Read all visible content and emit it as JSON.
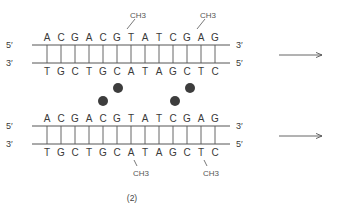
{
  "figure": {
    "caption": "(2)",
    "colors": {
      "line": "#555555",
      "text": "#3a3a3a",
      "dot": "#3d3d3d"
    },
    "duplexes": [
      {
        "id": "top",
        "top_strand": {
          "left_label": "5′",
          "right_label": "3′",
          "sequence": [
            "A",
            "C",
            "G",
            "A",
            "C",
            "G",
            "T",
            "A",
            "T",
            "C",
            "G",
            "A",
            "G"
          ]
        },
        "bottom_strand": {
          "left_label": "3′",
          "right_label": "5′",
          "sequence": [
            "T",
            "G",
            "C",
            "T",
            "G",
            "C",
            "A",
            "T",
            "A",
            "G",
            "C",
            "T",
            "C"
          ]
        },
        "methyl_groups": [
          {
            "label": "CH3",
            "strand": "top",
            "position": 6,
            "base": "G"
          },
          {
            "label": "CH3",
            "strand": "top",
            "position": 11,
            "base": "G"
          }
        ],
        "arrow": "right"
      },
      {
        "id": "bottom",
        "top_strand": {
          "left_label": "5′",
          "right_label": "3′",
          "sequence": [
            "A",
            "C",
            "G",
            "A",
            "C",
            "G",
            "T",
            "A",
            "T",
            "C",
            "G",
            "A",
            "G"
          ]
        },
        "bottom_strand": {
          "left_label": "3′",
          "right_label": "5′",
          "sequence": [
            "T",
            "G",
            "C",
            "T",
            "G",
            "C",
            "A",
            "T",
            "A",
            "G",
            "C",
            "T",
            "C"
          ]
        },
        "methyl_groups": [
          {
            "label": "CH3",
            "strand": "bottom",
            "position": 6,
            "base": "C"
          },
          {
            "label": "CH3",
            "strand": "bottom",
            "position": 11,
            "base": "C"
          }
        ],
        "arrow": "right"
      }
    ],
    "dots": [
      {
        "name": "dot-1",
        "x": 118,
        "y": 88
      },
      {
        "name": "dot-2",
        "x": 103,
        "y": 101
      },
      {
        "name": "dot-3",
        "x": 190,
        "y": 88
      },
      {
        "name": "dot-4",
        "x": 175,
        "y": 101
      }
    ]
  }
}
